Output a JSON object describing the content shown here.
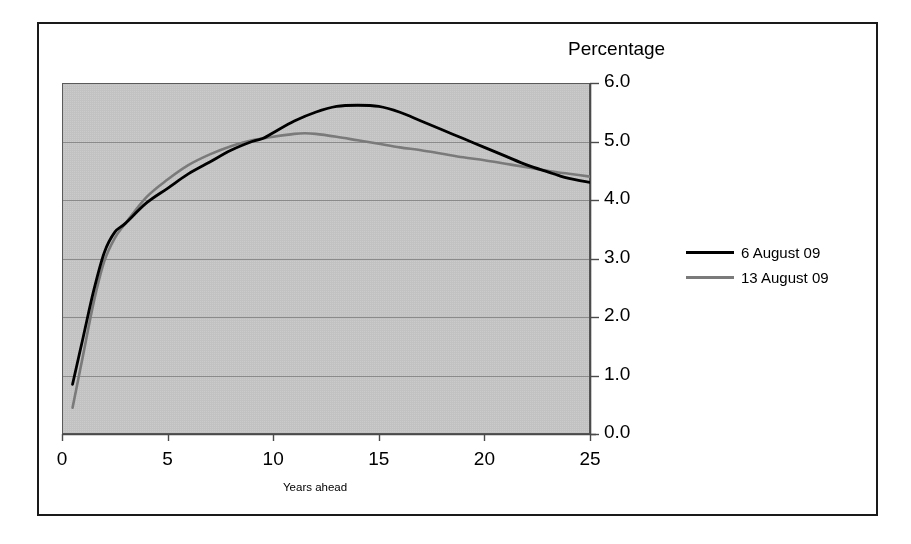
{
  "chart_data": {
    "type": "line",
    "title": "",
    "ylabel": "Percentage",
    "xlabel": "Years ahead",
    "xlim": [
      0,
      25
    ],
    "ylim": [
      0,
      6
    ],
    "grid": true,
    "legend_position": "right",
    "xticks": [
      "0",
      "5",
      "10",
      "15",
      "20",
      "25"
    ],
    "xtick_values": [
      0,
      5,
      10,
      15,
      20,
      25
    ],
    "yticks": [
      "0.0",
      "1.0",
      "2.0",
      "3.0",
      "4.0",
      "5.0",
      "6.0"
    ],
    "ytick_values": [
      0.0,
      1.0,
      2.0,
      3.0,
      4.0,
      5.0,
      6.0
    ],
    "series": [
      {
        "name": "6 August 09",
        "color": "#000000",
        "x": [
          0.5,
          1.0,
          1.5,
          2.0,
          2.5,
          3.0,
          4.0,
          5.0,
          6.0,
          7.0,
          8.0,
          9.0,
          9.5,
          10.0,
          11.0,
          12.0,
          13.0,
          14.0,
          15.0,
          16.0,
          17.0,
          18.0,
          19.0,
          20.0,
          21.0,
          22.0,
          23.0,
          23.5,
          24.0,
          25.0
        ],
        "y": [
          0.85,
          1.65,
          2.45,
          3.1,
          3.45,
          3.6,
          3.95,
          4.2,
          4.45,
          4.65,
          4.85,
          5.0,
          5.05,
          5.15,
          5.35,
          5.5,
          5.6,
          5.62,
          5.6,
          5.5,
          5.35,
          5.2,
          5.05,
          4.9,
          4.75,
          4.6,
          4.48,
          4.42,
          4.37,
          4.3
        ]
      },
      {
        "name": "13 August 09",
        "color": "#7a7a7a",
        "x": [
          0.5,
          1.0,
          1.5,
          2.0,
          2.5,
          3.0,
          4.0,
          5.0,
          6.0,
          7.0,
          8.0,
          9.0,
          9.5,
          10.0,
          11.0,
          11.5,
          12.0,
          13.0,
          14.0,
          15.0,
          16.0,
          17.0,
          18.0,
          19.0,
          20.0,
          21.0,
          22.0,
          23.0,
          23.5,
          24.0,
          25.0
        ],
        "y": [
          0.45,
          1.35,
          2.25,
          2.95,
          3.35,
          3.6,
          4.05,
          4.35,
          4.6,
          4.78,
          4.92,
          5.02,
          5.05,
          5.08,
          5.13,
          5.14,
          5.13,
          5.08,
          5.02,
          4.96,
          4.9,
          4.85,
          4.79,
          4.73,
          4.68,
          4.62,
          4.56,
          4.5,
          4.47,
          4.45,
          4.4
        ]
      }
    ]
  },
  "legend": {
    "entries": [
      {
        "label": "6 August 09"
      },
      {
        "label": "13 August 09"
      }
    ]
  },
  "colors": {
    "plot_background": "#c2c2c2",
    "gridline": "#8a8a8a",
    "axis": "#5a5a5a",
    "frame": "#1a1a1a",
    "series_0": "#000000",
    "series_1": "#7a7a7a"
  }
}
